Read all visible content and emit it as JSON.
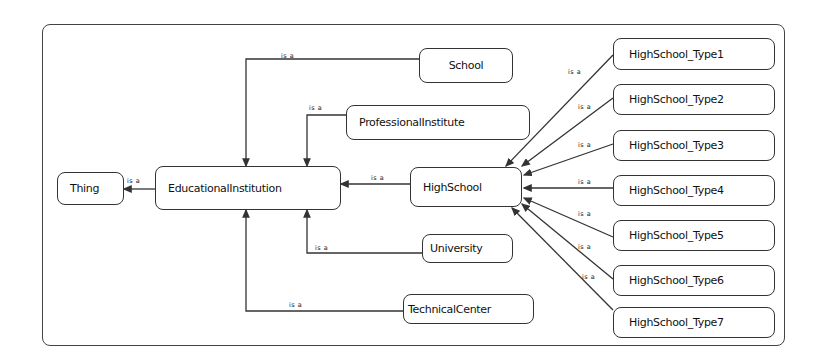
{
  "diagram": {
    "type": "ontology-class-hierarchy",
    "relation_label": "is a",
    "nodes": {
      "thing": "Thing",
      "educational_institution": "EducationalInstitution",
      "school": "School",
      "professional_institute": "ProfessionalInstitute",
      "high_school": "HighSchool",
      "university": "University",
      "technical_center": "TechnicalCenter",
      "high_school_types": [
        "HighSchool_Type1",
        "HighSchool_Type2",
        "HighSchool_Type3",
        "HighSchool_Type4",
        "HighSchool_Type5",
        "HighSchool_Type6",
        "HighSchool_Type7"
      ]
    },
    "edges": [
      {
        "from": "EducationalInstitution",
        "to": "Thing",
        "label": "is a"
      },
      {
        "from": "School",
        "to": "EducationalInstitution",
        "label": "is a"
      },
      {
        "from": "ProfessionalInstitute",
        "to": "EducationalInstitution",
        "label": "is a"
      },
      {
        "from": "HighSchool",
        "to": "EducationalInstitution",
        "label": "is a"
      },
      {
        "from": "University",
        "to": "EducationalInstitution",
        "label": "is a"
      },
      {
        "from": "TechnicalCenter",
        "to": "EducationalInstitution",
        "label": "is a"
      },
      {
        "from": "HighSchool_Type1",
        "to": "HighSchool",
        "label": "is a"
      },
      {
        "from": "HighSchool_Type2",
        "to": "HighSchool",
        "label": "is a"
      },
      {
        "from": "HighSchool_Type3",
        "to": "HighSchool",
        "label": "is a"
      },
      {
        "from": "HighSchool_Type4",
        "to": "HighSchool",
        "label": "is a"
      },
      {
        "from": "HighSchool_Type5",
        "to": "HighSchool",
        "label": "is a"
      },
      {
        "from": "HighSchool_Type6",
        "to": "HighSchool",
        "label": "is a"
      },
      {
        "from": "HighSchool_Type7",
        "to": "HighSchool",
        "label": "is a"
      }
    ]
  },
  "colors": {
    "line": "#333333",
    "background": "#ffffff",
    "text": "#111111"
  }
}
